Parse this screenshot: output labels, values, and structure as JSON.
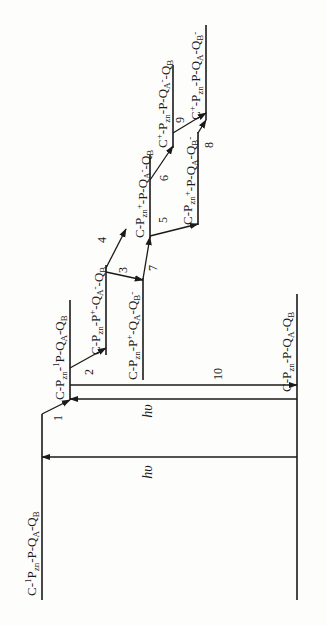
{
  "colors": {
    "ink": "#1a1a1a",
    "background": "#fdfdfc"
  },
  "states": [
    {
      "id": "ground",
      "label": [
        [
          "C-P",
          ""
        ],
        [
          "zn",
          "sub"
        ],
        [
          "-P-Q",
          ""
        ],
        [
          "A",
          "sub"
        ],
        [
          "-Q",
          ""
        ],
        [
          "B",
          "sub"
        ]
      ]
    },
    {
      "id": "c-1pzn",
      "label": [
        [
          "C-",
          ""
        ],
        [
          "1",
          "sup"
        ],
        [
          "P",
          ""
        ],
        [
          "zn",
          "sub"
        ],
        [
          "-P-Q",
          ""
        ],
        [
          "A",
          "sub"
        ],
        [
          "-Q",
          ""
        ],
        [
          "B",
          "sub"
        ]
      ]
    },
    {
      "id": "pzn-1p",
      "label": [
        [
          "C-P",
          ""
        ],
        [
          "zn",
          "sub"
        ],
        [
          "-",
          ""
        ],
        [
          "1",
          "sup"
        ],
        [
          "P-Q",
          ""
        ],
        [
          "A",
          "sub"
        ],
        [
          "-Q",
          ""
        ],
        [
          "B",
          "sub"
        ]
      ]
    },
    {
      "id": "p-plus-qa-minus",
      "label": [
        [
          "C-P",
          ""
        ],
        [
          "zn",
          "sub"
        ],
        [
          "-P",
          ""
        ],
        [
          "+",
          "sup"
        ],
        [
          "-Q",
          ""
        ],
        [
          "A",
          "sub"
        ],
        [
          "-",
          "sup"
        ],
        [
          "-Q",
          ""
        ],
        [
          "B",
          "sub"
        ]
      ]
    },
    {
      "id": "p-plus-qb-minus",
      "label": [
        [
          "C-P",
          ""
        ],
        [
          "zn",
          "sub"
        ],
        [
          "-P",
          ""
        ],
        [
          "+",
          "sup"
        ],
        [
          "-Q",
          ""
        ],
        [
          "A",
          "sub"
        ],
        [
          "-Q",
          ""
        ],
        [
          "B",
          "sub"
        ],
        [
          "-",
          "sup"
        ]
      ]
    },
    {
      "id": "pzn-plus-qa-minus",
      "label": [
        [
          "C-P",
          ""
        ],
        [
          "zn",
          "sub"
        ],
        [
          "+",
          "sup"
        ],
        [
          "-P-Q",
          ""
        ],
        [
          "A",
          "sub"
        ],
        [
          "-",
          "sup"
        ],
        [
          "-Q",
          ""
        ],
        [
          "B",
          "sub"
        ]
      ]
    },
    {
      "id": "pzn-plus-qb-minus",
      "label": [
        [
          "C-P",
          ""
        ],
        [
          "zn",
          "sub"
        ],
        [
          "+",
          "sup"
        ],
        [
          "-P-Q",
          ""
        ],
        [
          "A",
          "sub"
        ],
        [
          "-Q",
          ""
        ],
        [
          "B",
          "sub"
        ],
        [
          "-",
          "sup"
        ]
      ]
    },
    {
      "id": "c-plus-qa-minus",
      "label": [
        [
          "C",
          ""
        ],
        [
          "+",
          "sup"
        ],
        [
          "-P",
          ""
        ],
        [
          "zn",
          "sub"
        ],
        [
          "-P-Q",
          ""
        ],
        [
          "A",
          "sub"
        ],
        [
          "-",
          "sup"
        ],
        [
          "-Q",
          ""
        ],
        [
          "B",
          "sub"
        ]
      ]
    },
    {
      "id": "c-plus-qb-minus",
      "label": [
        [
          "C",
          ""
        ],
        [
          "+",
          "sup"
        ],
        [
          "-P",
          ""
        ],
        [
          "zn",
          "sub"
        ],
        [
          "-P-Q",
          ""
        ],
        [
          "A",
          "sub"
        ],
        [
          "-Q",
          ""
        ],
        [
          "B",
          "sub"
        ],
        [
          "-",
          "sup"
        ]
      ]
    }
  ],
  "transitions": [
    {
      "id": "1",
      "label": "1",
      "from": "c-1pzn",
      "to": "pzn-1p"
    },
    {
      "id": "2",
      "label": "2",
      "from": "pzn-1p",
      "to": "p-plus-qa-minus"
    },
    {
      "id": "3",
      "label": "3",
      "from": "p-plus-qa-minus",
      "to": "p-plus-qb-minus"
    },
    {
      "id": "4",
      "label": "4",
      "from": "p-plus-qa-minus",
      "to": "pzn-plus-qa-minus"
    },
    {
      "id": "5",
      "label": "5",
      "from": "pzn-plus-qa-minus",
      "to": "pzn-plus-qb-minus"
    },
    {
      "id": "6",
      "label": "6",
      "from": "pzn-plus-qa-minus",
      "to": "c-plus-qa-minus"
    },
    {
      "id": "7",
      "label": "7",
      "from": "p-plus-qb-minus",
      "to": "pzn-plus-qa-minus"
    },
    {
      "id": "8",
      "label": "8",
      "from": "pzn-plus-qb-minus",
      "to": "c-plus-qb-minus"
    },
    {
      "id": "9",
      "label": "9",
      "from": "c-plus-qa-minus",
      "to": "c-plus-qb-minus"
    },
    {
      "id": "10",
      "label": "10",
      "from": "pzn-1p",
      "to": "ground"
    },
    {
      "id": "hv1",
      "label": "hυ",
      "from": "ground",
      "to": "c-1pzn"
    },
    {
      "id": "hv2",
      "label": "hυ",
      "from": "ground",
      "to": "pzn-1p"
    }
  ]
}
